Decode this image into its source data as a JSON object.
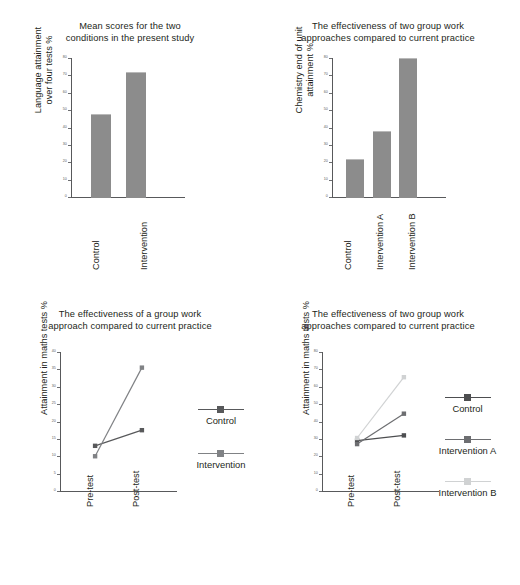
{
  "page": {
    "background": "#ffffff",
    "width": 520,
    "height": 585,
    "bar_color": "#8c8c8c",
    "axis_color": "#58595b",
    "text_color": "#231f20"
  },
  "charts": [
    {
      "id": "mean-scores-bar",
      "title_line1": "Mean scores for the two",
      "title_line2": "conditions in the present study",
      "ylabel_line1": "Language attainment",
      "ylabel_line2": "over four tests %",
      "chart_data": {
        "type": "bar",
        "title": "Mean scores for the two conditions in the present study",
        "xlabel": "",
        "ylabel": "Language attainment over four tests %",
        "categories": [
          "Control",
          "Intervention"
        ],
        "values": [
          48,
          72
        ],
        "ylim": [
          0,
          80
        ],
        "yticks": [
          0,
          10,
          20,
          30,
          40,
          50,
          60,
          70,
          80
        ],
        "grid": false,
        "legend": "none",
        "series_color": "#8c8c8c"
      }
    },
    {
      "id": "chemistry-unit-bar",
      "title_line1": "The effectiveness of two group work",
      "title_line2": "approaches compared to current practice",
      "ylabel_line1": "Chemistry end of unit",
      "ylabel_line2": "attainment %",
      "chart_data": {
        "type": "bar",
        "title": "The effectiveness of two group work approaches compared to current practice",
        "xlabel": "",
        "ylabel": "Chemistry end of unit attainment %",
        "categories": [
          "Control",
          "Intervention A",
          "Intervention B"
        ],
        "values": [
          22,
          38,
          80
        ],
        "ylim": [
          0,
          80
        ],
        "yticks": [
          0,
          10,
          20,
          30,
          40,
          50,
          60,
          70,
          80
        ],
        "grid": false,
        "legend": "none",
        "series_color": "#8c8c8c"
      }
    },
    {
      "id": "maths-one-intervention-line",
      "title_line1": "The effectiveness of a group work",
      "title_line2": "approach compared to current practice",
      "ylabel_line1": "Attainment in maths tests %",
      "ylabel_line2": "",
      "chart_data": {
        "type": "line",
        "title": "The effectiveness of a group work approach compared to current practice",
        "xlabel": "",
        "ylabel": "Attainment in maths tests %",
        "categories": [
          "Pre-test",
          "Post-test"
        ],
        "series": [
          {
            "name": "Control",
            "values": [
              13,
              17.5
            ],
            "color": "#58595b",
            "marker": "square"
          },
          {
            "name": "Intervention",
            "values": [
              10,
              35.5
            ],
            "color": "#808285",
            "marker": "square"
          }
        ],
        "ylim": [
          0,
          40
        ],
        "yticks": [
          0,
          5,
          10,
          15,
          20,
          25,
          30,
          35,
          40
        ],
        "grid": false,
        "legend": "right"
      }
    },
    {
      "id": "maths-two-interventions-line",
      "title_line1": "The effectiveness of two group work",
      "title_line2": "approaches compared to current practice",
      "ylabel_line1": "Attainment in maths tests %",
      "ylabel_line2": "",
      "chart_data": {
        "type": "line",
        "title": "The effectiveness of two group work approaches compared to current practice",
        "xlabel": "",
        "ylabel": "Attainment in maths tests %",
        "categories": [
          "Pre-test",
          "Post-test"
        ],
        "series": [
          {
            "name": "Control",
            "values": [
              29,
              32
            ],
            "color": "#4d4e50",
            "marker": "square"
          },
          {
            "name": "Intervention A",
            "values": [
              27,
              44.5
            ],
            "color": "#6d6e71",
            "marker": "square"
          },
          {
            "name": "Intervention B",
            "values": [
              30.5,
              65.5
            ],
            "color": "#d0d2d3",
            "marker": "square"
          }
        ],
        "ylim": [
          0,
          80
        ],
        "yticks": [
          0,
          10,
          20,
          30,
          40,
          50,
          60,
          70,
          80
        ],
        "grid": false,
        "legend": "right"
      }
    }
  ]
}
